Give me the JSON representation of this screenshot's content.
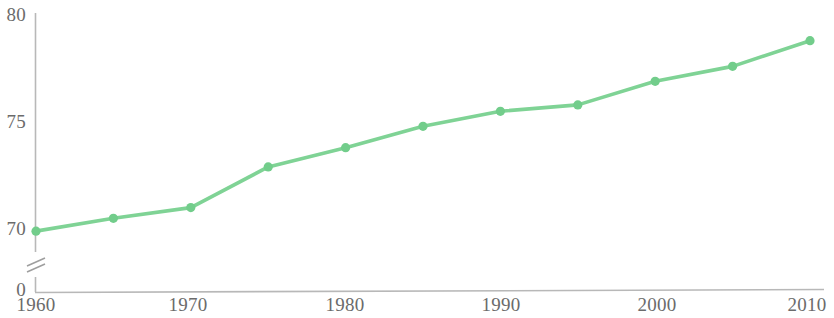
{
  "chart_data": {
    "type": "line",
    "title": "",
    "subtitle": "",
    "xlabel": "",
    "ylabel": "",
    "x": [
      1960,
      1965,
      1970,
      1975,
      1980,
      1985,
      1990,
      1995,
      2000,
      2005,
      2010
    ],
    "values": [
      69.9,
      70.5,
      71.0,
      72.9,
      73.8,
      74.8,
      75.5,
      75.8,
      76.9,
      77.6,
      78.8
    ],
    "series": [
      {
        "name": "",
        "values": [
          69.9,
          70.5,
          71.0,
          72.9,
          73.8,
          74.8,
          75.5,
          75.8,
          76.9,
          77.6,
          78.8
        ]
      }
    ],
    "xlim": [
      1960,
      2010
    ],
    "ylim": [
      69.3,
      80
    ],
    "y_axis_break": true,
    "y_axis_break_label": "0",
    "y_tick_labels": [
      "80",
      "75",
      "70",
      "0"
    ],
    "y_tick_values": [
      80,
      75,
      70,
      0
    ],
    "x_tick_labels": [
      "1960",
      "1970",
      "1980",
      "1990",
      "2000",
      "2010"
    ],
    "x_tick_values": [
      1960,
      1970,
      1980,
      1990,
      2000,
      2010
    ],
    "grid": false,
    "legend": "none",
    "line_color": "#7fd395",
    "marker_color": "#72cd8b",
    "axis_color": "#b5b5b5",
    "text_color": "#6b6b6b",
    "annotations": []
  },
  "axis": {
    "y_label_80": "80",
    "y_label_75": "75",
    "y_label_70": "70",
    "y_label_0": "0",
    "x_label_1960": "1960",
    "x_label_1970": "1970",
    "x_label_1980": "1980",
    "x_label_1990": "1990",
    "x_label_2000": "2000",
    "x_label_2010": "2010"
  }
}
